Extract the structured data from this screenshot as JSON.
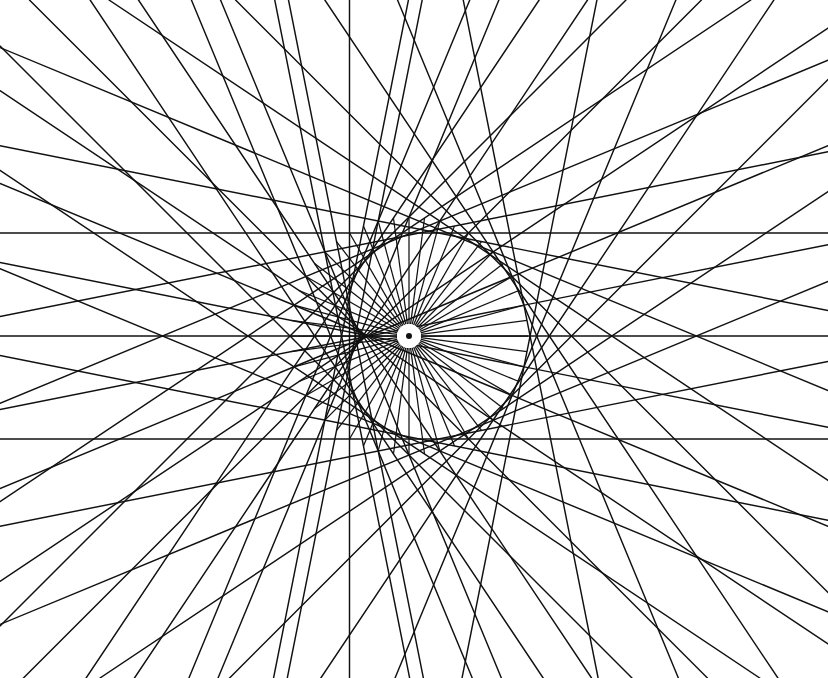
{
  "figure": {
    "kind": "geometric-line-figure",
    "canvas": {
      "width": 828,
      "height": 678,
      "background": "#ffffff"
    },
    "ink_color": "#111111",
    "paper_color": "#ffffff"
  },
  "chart_data": {
    "type": "scatter",
    "subtitle": "",
    "xlabel": "",
    "ylabel": "",
    "xlim": [
      0,
      828
    ],
    "ylim": [
      0,
      678
    ],
    "grid": false,
    "legend": "none",
    "annotations": [],
    "construction": {
      "method": "equally-spaced points on a circle joined by chords i -> (k*i mod n); every chord drawn as an infinite line clipped to the frame",
      "n_points": 48,
      "multiplier_k": 2,
      "circle_center_x": 409,
      "circle_center_y": 336,
      "circle_radius": 119,
      "envelope_shape": "cardioid-degenerate ring",
      "spoke_count": 48,
      "spoke_inner_radius": 12,
      "spoke_outer_radius": 119,
      "hub_disc_radius": 12,
      "hub_dot_radius": 3,
      "chord_stroke_width": 1.45,
      "spoke_stroke_width": 1.25,
      "start_angle_deg": 0,
      "horizontal_rail_y": [
        222,
        336,
        443
      ],
      "frame_clip": {
        "x": 0,
        "y": 0,
        "width": 828,
        "height": 678
      }
    },
    "series": [
      {
        "name": "extended chords",
        "count": 48,
        "values": []
      },
      {
        "name": "radial spokes",
        "count": 48,
        "values": []
      }
    ]
  }
}
